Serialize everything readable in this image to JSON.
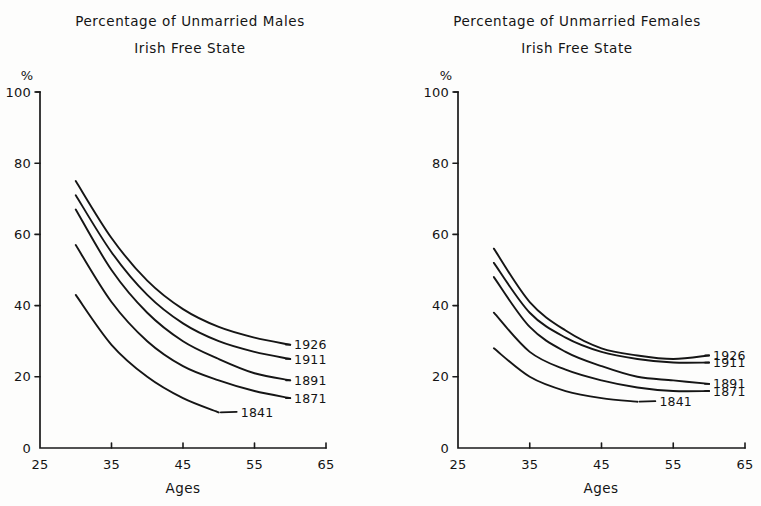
{
  "page": {
    "background": "#fdfdfc",
    "ink": "#151515"
  },
  "chart_data": [
    {
      "id": "males",
      "type": "line",
      "title": "Percentage of Unmarried Males",
      "subtitle": "Irish Free State",
      "xlabel": "Ages",
      "ylabel": "%",
      "xlim": [
        25,
        65
      ],
      "ylim": [
        0,
        100
      ],
      "xticks": [
        25,
        35,
        45,
        55,
        65
      ],
      "xticklabels": [
        "25",
        "35",
        "45",
        "55",
        "65"
      ],
      "yticks": [
        0,
        20,
        40,
        60,
        80,
        100
      ],
      "yticklabels": [
        "0",
        "20",
        "40",
        "60",
        "80",
        "100"
      ],
      "grid": false,
      "legend_position": "right-inline-labels",
      "origin_label": "0",
      "series": [
        {
          "name": "1926",
          "label": "1926",
          "x": [
            30,
            35,
            40,
            45,
            50,
            55,
            60
          ],
          "values": [
            75,
            59,
            47,
            39,
            34,
            31,
            29
          ]
        },
        {
          "name": "1911",
          "label": "1911",
          "x": [
            30,
            35,
            40,
            45,
            50,
            55,
            60
          ],
          "values": [
            71,
            55,
            43,
            35,
            30,
            27,
            25
          ]
        },
        {
          "name": "1891",
          "label": "1891",
          "x": [
            30,
            35,
            40,
            45,
            50,
            55,
            60
          ],
          "values": [
            67,
            50,
            38,
            30,
            25,
            21,
            19
          ]
        },
        {
          "name": "1871",
          "label": "1871",
          "x": [
            30,
            35,
            40,
            45,
            50,
            55,
            60
          ],
          "values": [
            57,
            41,
            30,
            23,
            19,
            16,
            14
          ]
        },
        {
          "name": "1841",
          "label": "1841",
          "x": [
            30,
            35,
            40,
            45,
            50
          ],
          "values": [
            43,
            29,
            20,
            14,
            10
          ]
        }
      ]
    },
    {
      "id": "females",
      "type": "line",
      "title": "Percentage of Unmarried Females",
      "subtitle": "Irish Free State",
      "xlabel": "Ages",
      "ylabel": "%",
      "xlim": [
        25,
        65
      ],
      "ylim": [
        0,
        100
      ],
      "xticks": [
        25,
        35,
        45,
        55,
        65
      ],
      "xticklabels": [
        "25",
        "35",
        "45",
        "55",
        "65"
      ],
      "yticks": [
        0,
        20,
        40,
        60,
        80,
        100
      ],
      "yticklabels": [
        "0",
        "20",
        "40",
        "60",
        "80",
        "100"
      ],
      "grid": false,
      "legend_position": "right-inline-labels",
      "origin_label": "0",
      "series": [
        {
          "name": "1926",
          "label": "1926",
          "x": [
            30,
            35,
            40,
            45,
            50,
            55,
            60
          ],
          "values": [
            56,
            41,
            33,
            28,
            26,
            25,
            26
          ]
        },
        {
          "name": "1911",
          "label": "1911",
          "x": [
            30,
            35,
            40,
            45,
            50,
            55,
            60
          ],
          "values": [
            52,
            38,
            31,
            27,
            25,
            24,
            24
          ]
        },
        {
          "name": "1891",
          "label": "1891",
          "x": [
            30,
            35,
            40,
            45,
            50,
            55,
            60
          ],
          "values": [
            48,
            34,
            27,
            23,
            20,
            19,
            18
          ]
        },
        {
          "name": "1871",
          "label": "1871",
          "x": [
            30,
            35,
            40,
            45,
            50,
            55,
            60
          ],
          "values": [
            38,
            27,
            22,
            19,
            17,
            16,
            16
          ]
        },
        {
          "name": "1841",
          "label": "1841",
          "x": [
            30,
            35,
            40,
            45,
            50
          ],
          "values": [
            28,
            20,
            16,
            14,
            13
          ]
        }
      ]
    }
  ]
}
